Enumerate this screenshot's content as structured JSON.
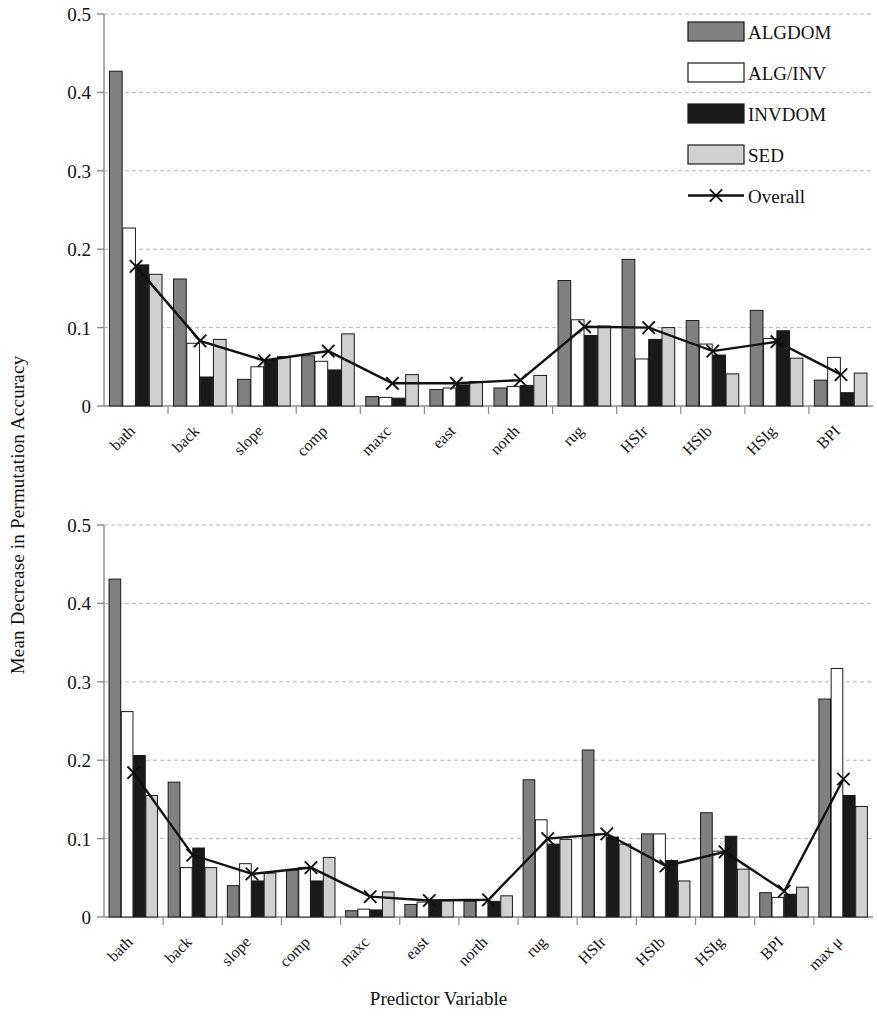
{
  "figure": {
    "ylabel": "Mean Decrease in Permutation Accuracy",
    "xlabel": "Predictor Variable"
  },
  "legend": {
    "position": "top-right",
    "items": [
      {
        "label": "ALGDOM",
        "swatch": "bar",
        "color": "#808080"
      },
      {
        "label": "ALG/INV",
        "swatch": "bar",
        "color": "#ffffff"
      },
      {
        "label": "INVDOM",
        "swatch": "bar",
        "color": "#1a1a1a"
      },
      {
        "label": "SED",
        "swatch": "bar",
        "color": "#d0d0d0"
      },
      {
        "label": "Overall",
        "swatch": "line-x",
        "color": "#111111"
      }
    ]
  },
  "axis": {
    "y_ticks": [
      "0",
      "0.1",
      "0.2",
      "0.3",
      "0.4",
      "0.5"
    ],
    "y_tick_values": [
      0,
      0.1,
      0.2,
      0.3,
      0.4,
      0.5
    ],
    "ylim": [
      0,
      0.5
    ]
  },
  "chart_data": [
    {
      "id": "panel-top",
      "type": "bar",
      "title": "",
      "xlabel": "",
      "ylabel": "Mean Decrease in Permutation Accuracy",
      "ylim": [
        0,
        0.5
      ],
      "grid": true,
      "legend_position": "top-right",
      "categories": [
        "bath",
        "back",
        "slope",
        "comp",
        "maxc",
        "east",
        "north",
        "rug",
        "HSIr",
        "HSIb",
        "HSIg",
        "BPI"
      ],
      "series": [
        {
          "name": "ALGDOM",
          "color": "#808080",
          "values": [
            0.427,
            0.162,
            0.034,
            0.064,
            0.012,
            0.021,
            0.023,
            0.16,
            0.187,
            0.109,
            0.122,
            0.033
          ]
        },
        {
          "name": "ALG/INV",
          "color": "#ffffff",
          "values": [
            0.227,
            0.08,
            0.05,
            0.057,
            0.011,
            0.023,
            0.025,
            0.11,
            0.06,
            0.079,
            0.086,
            0.062
          ]
        },
        {
          "name": "INVDOM",
          "color": "#1a1a1a",
          "values": [
            0.18,
            0.037,
            0.059,
            0.046,
            0.01,
            0.027,
            0.026,
            0.09,
            0.085,
            0.065,
            0.096,
            0.017
          ]
        },
        {
          "name": "SED",
          "color": "#d0d0d0",
          "values": [
            0.168,
            0.085,
            0.063,
            0.092,
            0.04,
            0.031,
            0.039,
            0.102,
            0.1,
            0.041,
            0.061,
            0.042
          ]
        }
      ],
      "overall": {
        "name": "Overall",
        "color": "#111111",
        "marker": "x",
        "values": [
          0.178,
          0.083,
          0.058,
          0.07,
          0.029,
          0.029,
          0.033,
          0.101,
          0.1,
          0.07,
          0.082,
          0.04
        ]
      }
    },
    {
      "id": "panel-bottom",
      "type": "bar",
      "title": "",
      "xlabel": "Predictor Variable",
      "ylabel": "Mean Decrease in Permutation Accuracy",
      "ylim": [
        0,
        0.5
      ],
      "grid": true,
      "legend_position": "none",
      "categories": [
        "bath",
        "back",
        "slope",
        "comp",
        "maxc",
        "east",
        "north",
        "rug",
        "HSIr",
        "HSIb",
        "HSIg",
        "BPI",
        "max μ"
      ],
      "series": [
        {
          "name": "ALGDOM",
          "color": "#808080",
          "values": [
            0.431,
            0.172,
            0.04,
            0.06,
            0.008,
            0.016,
            0.02,
            0.175,
            0.213,
            0.106,
            0.133,
            0.031,
            0.278
          ]
        },
        {
          "name": "ALG/INV",
          "color": "#ffffff",
          "values": [
            0.262,
            0.063,
            0.068,
            0.063,
            0.01,
            0.019,
            0.021,
            0.124,
            0.106,
            0.106,
            0.084,
            0.025,
            0.317
          ]
        },
        {
          "name": "INVDOM",
          "color": "#1a1a1a",
          "values": [
            0.206,
            0.088,
            0.046,
            0.046,
            0.009,
            0.02,
            0.02,
            0.093,
            0.102,
            0.072,
            0.103,
            0.029,
            0.155
          ]
        },
        {
          "name": "SED",
          "color": "#d0d0d0",
          "values": [
            0.155,
            0.063,
            0.056,
            0.076,
            0.032,
            0.021,
            0.027,
            0.099,
            0.093,
            0.046,
            0.061,
            0.038,
            0.141
          ]
        }
      ],
      "overall": {
        "name": "Overall",
        "color": "#111111",
        "marker": "x",
        "values": [
          0.184,
          0.079,
          0.055,
          0.063,
          0.026,
          0.021,
          0.022,
          0.1,
          0.106,
          0.065,
          0.083,
          0.033,
          0.176
        ]
      }
    }
  ]
}
